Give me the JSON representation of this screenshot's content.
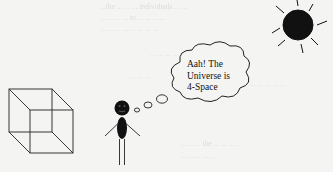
{
  "diagram": {
    "thought_bubble": {
      "lines": [
        "Aah! The",
        "Universe is",
        "4-Space"
      ]
    },
    "elements": [
      {
        "name": "wireframe-cube",
        "description": "Necker cube wireframe at left"
      },
      {
        "name": "stick-figure",
        "description": "Black stick figure with round head"
      },
      {
        "name": "thought-bubble",
        "description": "Cloud thought bubble connected by three small circles"
      },
      {
        "name": "sun",
        "description": "Black sun with rays, top right"
      }
    ],
    "colors": {
      "background": "#f4f4f2",
      "ink": "#111111",
      "bleed_text": "#c9c9c7"
    }
  },
  "background_text": {
    "note": "faint show-through text from scanned page, largely illegible",
    "fragments": [
      "...the ... ... ... individuals ... ...",
      "... ... ... ... to ... ... ... ...",
      "... ... ... ... ... ... ... ...",
      "... ... ... ... ... ... and ... ... ...",
      "... ... ...",
      "... ... ... ... ...",
      "... ... ... the ... ... ... ...",
      "... ... ... ... ..."
    ]
  }
}
